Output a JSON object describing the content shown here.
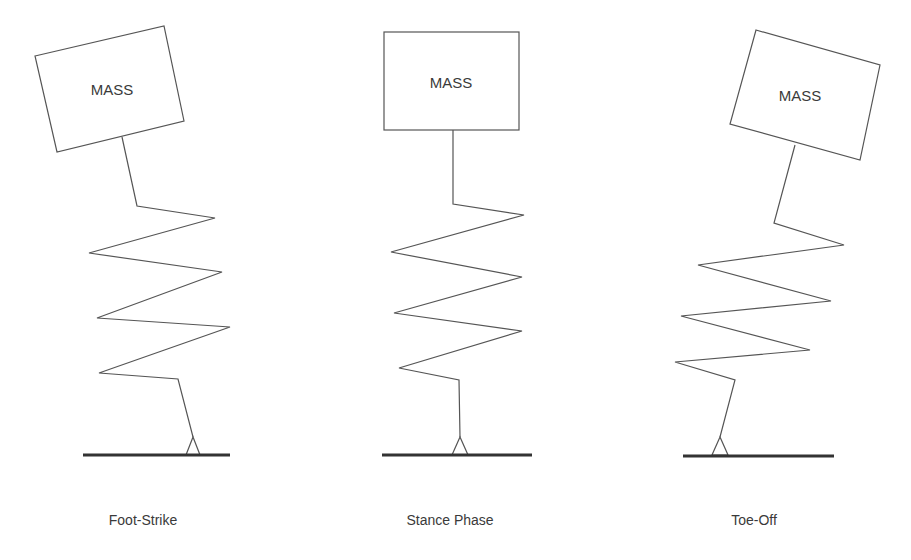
{
  "diagram": {
    "panels": [
      {
        "mass_label": "MASS",
        "caption": "Foot-Strike"
      },
      {
        "mass_label": "MASS",
        "caption": "Stance Phase"
      },
      {
        "mass_label": "MASS",
        "caption": "Toe-Off"
      }
    ]
  }
}
